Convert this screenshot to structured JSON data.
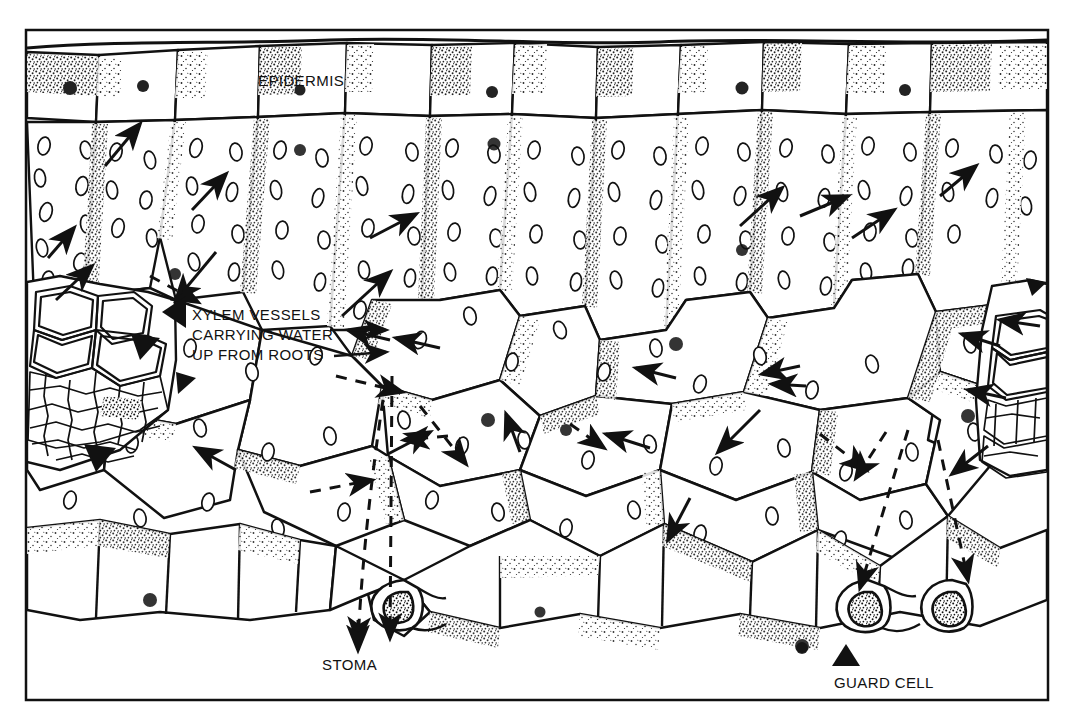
{
  "figure": {
    "background_color": "#ffffff",
    "ink_color": "#111111",
    "frame": {
      "x": 26,
      "y": 30,
      "width": 1022,
      "height": 670,
      "stroke_width": 2.5
    }
  },
  "labels": {
    "epidermis": "EPIDERMIS",
    "xylem_line1": "XYLEM VESSELS",
    "xylem_line2": "CARRYING WATER",
    "xylem_line3": "UP FROM ROOTS",
    "stoma": "STOMA",
    "guard_cell": "GUARD CELL"
  },
  "legend_semantics": {
    "solid_arrow": "liquid water movement through cells",
    "dashed_arrow": "water vapour diffusing through air spaces and out of the stoma",
    "black_triangle": "pointer marker to labelled structure"
  },
  "structures": [
    {
      "name": "upper-epidermis",
      "description": "row of rectangular cells with cuticle along the top edge"
    },
    {
      "name": "palisade-mesophyll",
      "description": "tall columnar cells packed with chloroplasts below the upper epidermis"
    },
    {
      "name": "spongy-mesophyll",
      "description": "irregular rounded cells with large air spaces between them"
    },
    {
      "name": "xylem-vessel-left",
      "description": "vascular bundle with thick-walled vessels at the left"
    },
    {
      "name": "xylem-vessel-right",
      "description": "vascular bundle with thick-walled vessels at the right edge"
    },
    {
      "name": "lower-epidermis",
      "description": "row of cells forming the underside of the leaf"
    },
    {
      "name": "stoma",
      "description": "pore in the lower epidermis between two guard cells"
    },
    {
      "name": "guard-cell",
      "description": "kidney-shaped cell flanking the stomatal pore"
    }
  ]
}
